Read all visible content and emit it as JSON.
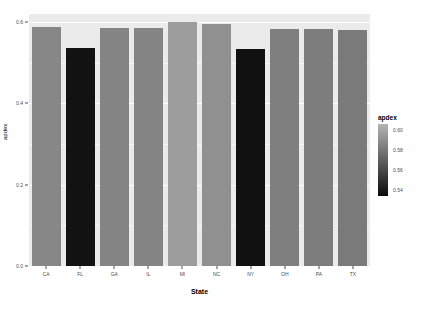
{
  "chart_data": {
    "type": "bar",
    "title": "",
    "xlabel": "State",
    "ylabel": "apdex",
    "categories": [
      "CA",
      "FL",
      "GA",
      "IL",
      "MI",
      "NC",
      "NY",
      "OH",
      "PA",
      "TX"
    ],
    "values": [
      0.588,
      0.537,
      0.585,
      0.585,
      0.601,
      0.595,
      0.535,
      0.583,
      0.582,
      0.58
    ],
    "ylim": [
      0.0,
      0.62
    ],
    "ytick_labels": [
      "0.0",
      "0.2",
      "0.4",
      "0.6"
    ],
    "ytick_values": [
      0.0,
      0.2,
      0.4,
      0.6
    ],
    "grid": true,
    "legend": {
      "title": "apdex",
      "position": "right",
      "type": "continuous-colorbar",
      "tick_labels": [
        "0.60",
        "0.58",
        "0.56",
        "0.54"
      ],
      "tick_values": [
        0.6,
        0.58,
        0.56,
        0.54
      ],
      "gradient_high_color": "#b4b4b4",
      "gradient_low_color": "#0b0b0b"
    },
    "bar_colors": [
      "#878787",
      "#121212",
      "#848484",
      "#848484",
      "#9d9d9d",
      "#909090",
      "#101010",
      "#7f7f7f",
      "#7d7d7d",
      "#7a7a7a"
    ],
    "panel_background": "#ebebeb",
    "plot_background": "#ffffff"
  }
}
